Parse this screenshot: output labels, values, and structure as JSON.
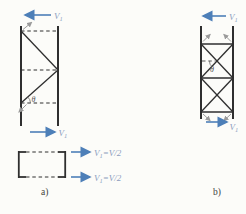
{
  "figure": {
    "caption_a": "a)",
    "caption_b": "b)",
    "angle_label": "θ",
    "force_label": {
      "base": "V",
      "sub": "1"
    },
    "shear_split_label": {
      "base": "V",
      "sub": "1",
      "rest": "=V/2"
    }
  },
  "colors": {
    "background": "#fcfcf9",
    "line": "#2f2f2f",
    "arrow_blue": "#4d7fb8",
    "label_blue": "#8c9cbe",
    "gray_arrow": "#9b9b9b",
    "text_dark": "#3f3f3c"
  }
}
